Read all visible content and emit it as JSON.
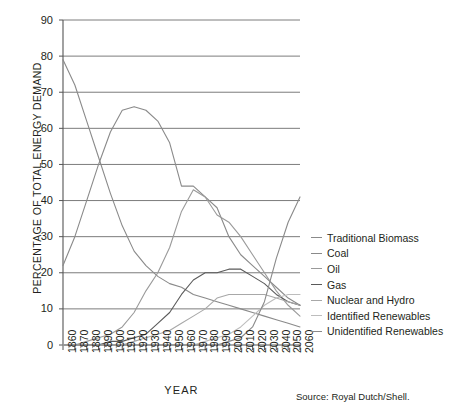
{
  "chart_data": {
    "type": "line",
    "title": "",
    "xlabel": "YEAR",
    "ylabel": "PERCENTAGE OF TOTAL ENERGY DEMAND",
    "xlim": [
      1860,
      2060
    ],
    "ylim": [
      0,
      90
    ],
    "ytick_step": 10,
    "xtick_step": 10,
    "grid": "horizontal",
    "legend_position": "right",
    "source_note": "Source: Royal Dutch/Shell.",
    "ytick_labels": [
      "0",
      "10",
      "20",
      "30",
      "40",
      "50",
      "60",
      "70",
      "80",
      "90"
    ],
    "xtick_labels": [
      "1860",
      "1870",
      "1880",
      "1890",
      "1900",
      "1910",
      "1920",
      "1930",
      "1940",
      "1950",
      "1960",
      "1970",
      "1980",
      "1990",
      "2000",
      "2010",
      "2020",
      "2030",
      "2040",
      "2050",
      "2060"
    ],
    "legend_labels": [
      "Traditional Biomass",
      "Coal",
      "Oil",
      "Gas",
      "Nuclear and Hydro",
      "Identified Renewables",
      "Unidentified Renewables"
    ],
    "series": [
      {
        "name": "Traditional Biomass",
        "color": "#8a8a8a",
        "x": [
          1860,
          1870,
          1880,
          1890,
          1900,
          1910,
          1920,
          1930,
          1940,
          1950,
          1960,
          1970,
          1980,
          1990,
          2000,
          2010,
          2020,
          2030,
          2040,
          2050,
          2060
        ],
        "values": [
          79,
          72,
          62,
          52,
          42,
          33,
          26,
          22,
          19,
          17,
          16,
          14,
          13,
          12,
          11,
          10,
          9,
          8,
          7,
          6,
          5
        ]
      },
      {
        "name": "Coal",
        "color": "#8a8a8a",
        "x": [
          1860,
          1870,
          1880,
          1890,
          1900,
          1910,
          1920,
          1930,
          1940,
          1950,
          1960,
          1970,
          1980,
          1990,
          2000,
          2010,
          2020,
          2030,
          2040,
          2050,
          2060
        ],
        "values": [
          22,
          30,
          40,
          50,
          59,
          65,
          66,
          65,
          62,
          56,
          44,
          44,
          41,
          38,
          30,
          25,
          22,
          19,
          16,
          13,
          11
        ]
      },
      {
        "name": "Oil",
        "color": "#9a9a9a",
        "x": [
          1860,
          1870,
          1880,
          1890,
          1900,
          1910,
          1920,
          1930,
          1940,
          1950,
          1960,
          1970,
          1980,
          1990,
          2000,
          2010,
          2020,
          2030,
          2040,
          2050,
          2060
        ],
        "values": [
          0,
          0,
          1,
          2,
          3,
          5,
          9,
          15,
          20,
          27,
          37,
          43,
          41,
          36,
          34,
          30,
          25,
          20,
          15,
          11,
          8
        ]
      },
      {
        "name": "Gas",
        "color": "#5a5a5a",
        "x": [
          1860,
          1870,
          1880,
          1890,
          1900,
          1910,
          1920,
          1930,
          1940,
          1950,
          1960,
          1970,
          1980,
          1990,
          2000,
          2010,
          2020,
          2030,
          2040,
          2050,
          2060
        ],
        "values": [
          0,
          0,
          0,
          0,
          1,
          1,
          2,
          3,
          6,
          9,
          14,
          18,
          20,
          20,
          21,
          21,
          19,
          17,
          14,
          12,
          11
        ]
      },
      {
        "name": "Nuclear and Hydro",
        "color": "#a8a8a8",
        "x": [
          1860,
          1870,
          1880,
          1890,
          1900,
          1910,
          1920,
          1930,
          1940,
          1950,
          1960,
          1970,
          1980,
          1990,
          2000,
          2010,
          2020,
          2030,
          2040,
          2050,
          2060
        ],
        "values": [
          0,
          0,
          0,
          0,
          0,
          0,
          1,
          2,
          3,
          4,
          6,
          8,
          10,
          13,
          14,
          14,
          14,
          14,
          13,
          12,
          11
        ]
      },
      {
        "name": "Identified Renewables",
        "color": "#bdbdbd",
        "x": [
          1860,
          1870,
          1880,
          1890,
          1900,
          1910,
          1920,
          1930,
          1940,
          1950,
          1960,
          1970,
          1980,
          1990,
          2000,
          2010,
          2020,
          2030,
          2040,
          2050,
          2060
        ],
        "values": [
          0,
          0,
          0,
          0,
          0,
          0,
          0,
          0,
          0,
          0,
          0,
          0,
          1,
          2,
          3,
          5,
          8,
          11,
          13,
          14,
          14
        ]
      },
      {
        "name": "Unidentified Renewables",
        "color": "#8a8a8a",
        "x": [
          1860,
          1870,
          1880,
          1890,
          1900,
          1910,
          1920,
          1930,
          1940,
          1950,
          1960,
          1970,
          1980,
          1990,
          2000,
          2010,
          2020,
          2030,
          2040,
          2050,
          2060
        ],
        "values": [
          0,
          0,
          0,
          0,
          0,
          0,
          0,
          0,
          0,
          0,
          0,
          0,
          0,
          0,
          1,
          2,
          5,
          12,
          24,
          34,
          41
        ]
      }
    ]
  }
}
